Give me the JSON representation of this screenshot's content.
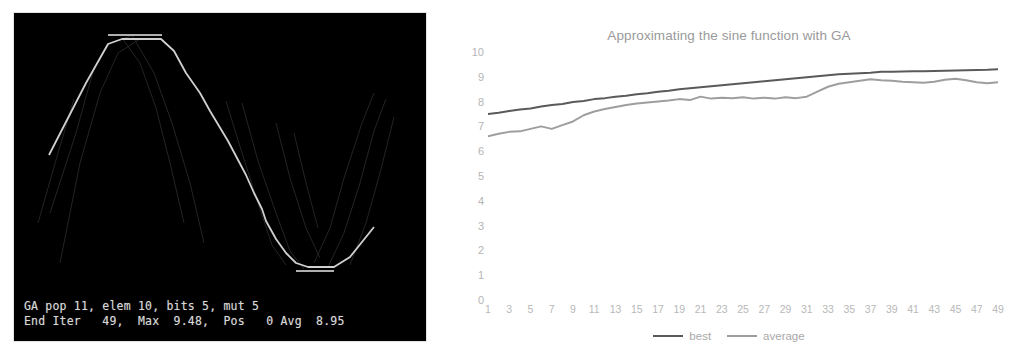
{
  "terminal": {
    "background_color": "#000000",
    "text_color": "#d8d8d8",
    "line1": "GA pop 11, elem 10, bits 5, mut 5",
    "line2": "End Iter   49,  Max  9.48,  Pos   0 Avg  8.95",
    "params": {
      "pop_label": "GA pop",
      "pop": "11",
      "elem_label": "elem",
      "elem": "10",
      "bits_label": "bits",
      "bits": "5",
      "mut_label": "mut",
      "mut": "5"
    },
    "status": {
      "end_iter_label": "End Iter",
      "end_iter": "49",
      "max_label": "Max",
      "max": "9.48",
      "pos_label": "Pos",
      "pos": "0",
      "avg_label": "Avg",
      "avg": "8.95"
    },
    "curve_color": "#e8e8e8",
    "ghost_color": "#2a2a2a"
  },
  "chart_data": {
    "type": "line",
    "title": "Approximating the sine function with GA",
    "xlabel": "",
    "ylabel": "",
    "ylim": [
      0,
      10
    ],
    "xlim": [
      1,
      49
    ],
    "grid": false,
    "legend_position": "bottom",
    "y_ticks": [
      10,
      9,
      8,
      7,
      6,
      5,
      4,
      3,
      2,
      1,
      0
    ],
    "x_ticks": [
      1,
      3,
      5,
      7,
      9,
      11,
      13,
      15,
      17,
      19,
      21,
      23,
      25,
      27,
      29,
      31,
      33,
      35,
      37,
      39,
      41,
      43,
      45,
      47,
      49
    ],
    "x": [
      1,
      2,
      3,
      4,
      5,
      6,
      7,
      8,
      9,
      10,
      11,
      12,
      13,
      14,
      15,
      16,
      17,
      18,
      19,
      20,
      21,
      22,
      23,
      24,
      25,
      26,
      27,
      28,
      29,
      30,
      31,
      32,
      33,
      34,
      35,
      36,
      37,
      38,
      39,
      40,
      41,
      42,
      43,
      44,
      45,
      46,
      47,
      48,
      49
    ],
    "series": [
      {
        "name": "best",
        "color": "#5a5a5a",
        "values": [
          7.5,
          7.55,
          7.62,
          7.68,
          7.72,
          7.8,
          7.86,
          7.9,
          7.98,
          8.02,
          8.1,
          8.14,
          8.2,
          8.24,
          8.3,
          8.34,
          8.4,
          8.44,
          8.5,
          8.54,
          8.58,
          8.62,
          8.66,
          8.7,
          8.74,
          8.78,
          8.82,
          8.86,
          8.9,
          8.94,
          8.98,
          9.02,
          9.06,
          9.1,
          9.12,
          9.14,
          9.16,
          9.2,
          9.2,
          9.21,
          9.22,
          9.22,
          9.23,
          9.24,
          9.25,
          9.26,
          9.27,
          9.28,
          9.3
        ]
      },
      {
        "name": "average",
        "color": "#9e9e9e",
        "values": [
          6.6,
          6.7,
          6.78,
          6.8,
          6.9,
          7.0,
          6.9,
          7.05,
          7.2,
          7.45,
          7.6,
          7.7,
          7.78,
          7.86,
          7.92,
          7.96,
          8.0,
          8.04,
          8.1,
          8.06,
          8.2,
          8.12,
          8.16,
          8.14,
          8.18,
          8.12,
          8.16,
          8.12,
          8.18,
          8.14,
          8.2,
          8.4,
          8.6,
          8.72,
          8.78,
          8.84,
          8.9,
          8.86,
          8.84,
          8.8,
          8.78,
          8.76,
          8.8,
          8.88,
          8.92,
          8.86,
          8.78,
          8.74,
          8.78
        ]
      }
    ]
  },
  "legend": {
    "items": [
      {
        "label": "best",
        "color": "#5a5a5a"
      },
      {
        "label": "average",
        "color": "#9e9e9e"
      }
    ]
  }
}
